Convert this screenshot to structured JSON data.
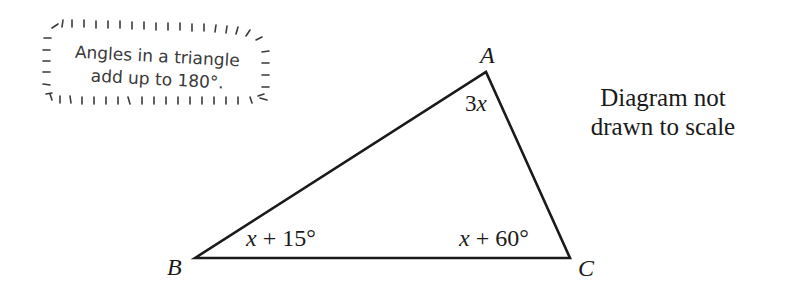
{
  "hint_box": {
    "line1": "Angles in a triangle",
    "line2": "add up to 180°."
  },
  "note": {
    "line1": "Diagram not",
    "line2": "drawn to scale"
  },
  "triangle": {
    "vertices": {
      "A": {
        "label": "A",
        "x": 486,
        "y": 72
      },
      "B": {
        "label": "B",
        "x": 195,
        "y": 258
      },
      "C": {
        "label": "C",
        "x": 570,
        "y": 258
      }
    },
    "angles": {
      "A": "3x",
      "B": "x + 15°",
      "C": "x + 60°"
    },
    "stroke_color": "#1a1a1a"
  }
}
